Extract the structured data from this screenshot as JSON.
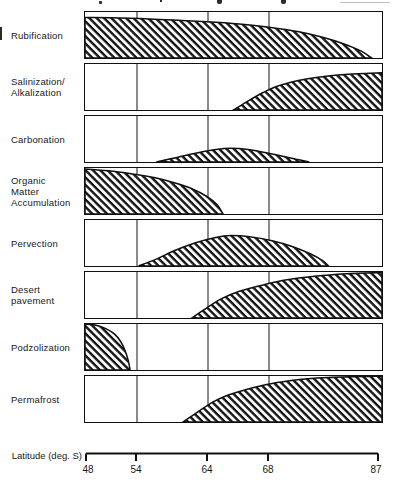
{
  "axis": {
    "label": "Latitude (deg. S)",
    "ticks": [
      {
        "label": "48"
      },
      {
        "label": "54"
      },
      {
        "label": "64"
      },
      {
        "label": "68"
      },
      {
        "label": "87"
      }
    ]
  },
  "colors": {
    "ink": "#101010",
    "paper": "#ffffff"
  },
  "chart_data": {
    "type": "area",
    "title": "",
    "x_axis": {
      "label": "Latitude (deg. S)",
      "ticks": [
        48,
        54,
        64,
        68,
        87
      ],
      "spacing": "non-linear schematic; tick fractions across panel = 0, 0.172, 0.414, 0.616, 1.0"
    },
    "y_axis": {
      "label": "relative intensity (fraction of panel height)",
      "range": [
        0,
        1
      ]
    },
    "legend": "none; hatched area = relative importance of each soil-forming process",
    "series": [
      {
        "name": "Rubification",
        "label_lines": [
          "Rubification"
        ],
        "points_lat_intensity": [
          [
            48,
            0.88
          ],
          [
            52,
            0.87
          ],
          [
            57,
            0.84
          ],
          [
            64,
            0.79
          ],
          [
            66,
            0.74
          ],
          [
            68,
            0.67
          ],
          [
            73,
            0.57
          ],
          [
            77,
            0.45
          ],
          [
            80.5,
            0.31
          ],
          [
            83.5,
            0.15
          ],
          [
            85.5,
            0
          ]
        ],
        "envelope_fracs": [
          [
            0,
            0.88
          ],
          [
            0.12,
            0.87
          ],
          [
            0.25,
            0.84
          ],
          [
            0.41,
            0.79
          ],
          [
            0.52,
            0.74
          ],
          [
            0.62,
            0.67
          ],
          [
            0.72,
            0.57
          ],
          [
            0.8,
            0.45
          ],
          [
            0.87,
            0.31
          ],
          [
            0.93,
            0.15
          ],
          [
            0.965,
            0
          ]
        ]
      },
      {
        "name": "Salinization/Alkalization",
        "label_lines": [
          "Salinization/",
          "Alkalization"
        ],
        "points_lat_intensity": [
          [
            65.5,
            0
          ],
          [
            66.5,
            0.2
          ],
          [
            67.5,
            0.38
          ],
          [
            68.5,
            0.5
          ],
          [
            71.5,
            0.6
          ],
          [
            74.5,
            0.68
          ],
          [
            78,
            0.74
          ],
          [
            82,
            0.78
          ],
          [
            87,
            0.81
          ]
        ],
        "envelope_fracs": [
          [
            0.5,
            0
          ],
          [
            0.55,
            0.2
          ],
          [
            0.6,
            0.38
          ],
          [
            0.64,
            0.5
          ],
          [
            0.69,
            0.6
          ],
          [
            0.75,
            0.68
          ],
          [
            0.82,
            0.74
          ],
          [
            0.9,
            0.78
          ],
          [
            1,
            0.81
          ]
        ]
      },
      {
        "name": "Carbonation",
        "label_lines": [
          "Carbonation"
        ],
        "points_lat_intensity": [
          [
            57,
            0
          ],
          [
            59.5,
            0.1
          ],
          [
            62.5,
            0.2
          ],
          [
            64.5,
            0.27
          ],
          [
            65.5,
            0.3
          ],
          [
            66.5,
            0.27
          ],
          [
            68,
            0.2
          ],
          [
            70.5,
            0.12
          ],
          [
            73,
            0.05
          ],
          [
            75,
            0
          ]
        ],
        "envelope_fracs": [
          [
            0.24,
            0
          ],
          [
            0.31,
            0.1
          ],
          [
            0.38,
            0.2
          ],
          [
            0.44,
            0.27
          ],
          [
            0.49,
            0.3
          ],
          [
            0.55,
            0.27
          ],
          [
            0.61,
            0.2
          ],
          [
            0.67,
            0.12
          ],
          [
            0.72,
            0.05
          ],
          [
            0.755,
            0
          ]
        ]
      },
      {
        "name": "Organic Matter Accumulation",
        "label_lines": [
          "Organic",
          "Matter",
          "Accumulation"
        ],
        "points_lat_intensity": [
          [
            48,
            0.98
          ],
          [
            51,
            0.94
          ],
          [
            53.5,
            0.87
          ],
          [
            57,
            0.78
          ],
          [
            59.5,
            0.68
          ],
          [
            62,
            0.55
          ],
          [
            64,
            0.38
          ],
          [
            64.5,
            0.2
          ],
          [
            65,
            0
          ]
        ],
        "envelope_fracs": [
          [
            0,
            0.98
          ],
          [
            0.08,
            0.94
          ],
          [
            0.16,
            0.87
          ],
          [
            0.24,
            0.78
          ],
          [
            0.3,
            0.68
          ],
          [
            0.36,
            0.55
          ],
          [
            0.41,
            0.38
          ],
          [
            0.445,
            0.2
          ],
          [
            0.465,
            0
          ]
        ]
      },
      {
        "name": "Pervection",
        "label_lines": [
          "Pervection"
        ],
        "points_lat_intensity": [
          [
            54,
            0
          ],
          [
            57,
            0.15
          ],
          [
            59.5,
            0.33
          ],
          [
            62,
            0.5
          ],
          [
            64.5,
            0.62
          ],
          [
            65.5,
            0.66
          ],
          [
            67,
            0.63
          ],
          [
            68.5,
            0.55
          ],
          [
            72,
            0.42
          ],
          [
            75,
            0.26
          ],
          [
            77,
            0.12
          ],
          [
            78,
            0
          ]
        ],
        "envelope_fracs": [
          [
            0.18,
            0
          ],
          [
            0.24,
            0.15
          ],
          [
            0.3,
            0.33
          ],
          [
            0.37,
            0.5
          ],
          [
            0.44,
            0.62
          ],
          [
            0.49,
            0.66
          ],
          [
            0.56,
            0.63
          ],
          [
            0.63,
            0.55
          ],
          [
            0.7,
            0.42
          ],
          [
            0.76,
            0.26
          ],
          [
            0.8,
            0.12
          ],
          [
            0.82,
            0
          ]
        ]
      },
      {
        "name": "Desert pavement",
        "label_lines": [
          "Desert",
          "pavement"
        ],
        "points_lat_intensity": [
          [
            62,
            0
          ],
          [
            64,
            0.22
          ],
          [
            65,
            0.42
          ],
          [
            66,
            0.58
          ],
          [
            67.5,
            0.72
          ],
          [
            71,
            0.83
          ],
          [
            76,
            0.91
          ],
          [
            81,
            0.96
          ],
          [
            87,
            0.99
          ]
        ],
        "envelope_fracs": [
          [
            0.36,
            0
          ],
          [
            0.41,
            0.22
          ],
          [
            0.46,
            0.42
          ],
          [
            0.52,
            0.58
          ],
          [
            0.6,
            0.72
          ],
          [
            0.68,
            0.83
          ],
          [
            0.78,
            0.91
          ],
          [
            0.88,
            0.96
          ],
          [
            1,
            0.99
          ]
        ]
      },
      {
        "name": "Podzolization",
        "label_lines": [
          "Podzolization"
        ],
        "points_lat_intensity": [
          [
            48,
            1
          ],
          [
            49.5,
            0.97
          ],
          [
            50.5,
            0.9
          ],
          [
            51.5,
            0.78
          ],
          [
            52,
            0.62
          ],
          [
            52.5,
            0.42
          ],
          [
            53,
            0.22
          ],
          [
            53.2,
            0
          ]
        ],
        "envelope_fracs": [
          [
            0,
            1
          ],
          [
            0.04,
            0.97
          ],
          [
            0.07,
            0.9
          ],
          [
            0.1,
            0.78
          ],
          [
            0.12,
            0.62
          ],
          [
            0.135,
            0.42
          ],
          [
            0.145,
            0.22
          ],
          [
            0.152,
            0
          ]
        ]
      },
      {
        "name": "Permafrost",
        "label_lines": [
          "Permafrost"
        ],
        "points_lat_intensity": [
          [
            60.5,
            0
          ],
          [
            62.5,
            0.22
          ],
          [
            64.5,
            0.43
          ],
          [
            65.5,
            0.58
          ],
          [
            66.5,
            0.7
          ],
          [
            67.5,
            0.8
          ],
          [
            70,
            0.87
          ],
          [
            73.5,
            0.93
          ],
          [
            78,
            0.97
          ],
          [
            87,
            1
          ]
        ],
        "envelope_fracs": [
          [
            0.33,
            0
          ],
          [
            0.38,
            0.22
          ],
          [
            0.43,
            0.43
          ],
          [
            0.48,
            0.58
          ],
          [
            0.54,
            0.7
          ],
          [
            0.6,
            0.8
          ],
          [
            0.66,
            0.87
          ],
          [
            0.73,
            0.93
          ],
          [
            0.82,
            0.97
          ],
          [
            1,
            1
          ]
        ]
      }
    ]
  }
}
